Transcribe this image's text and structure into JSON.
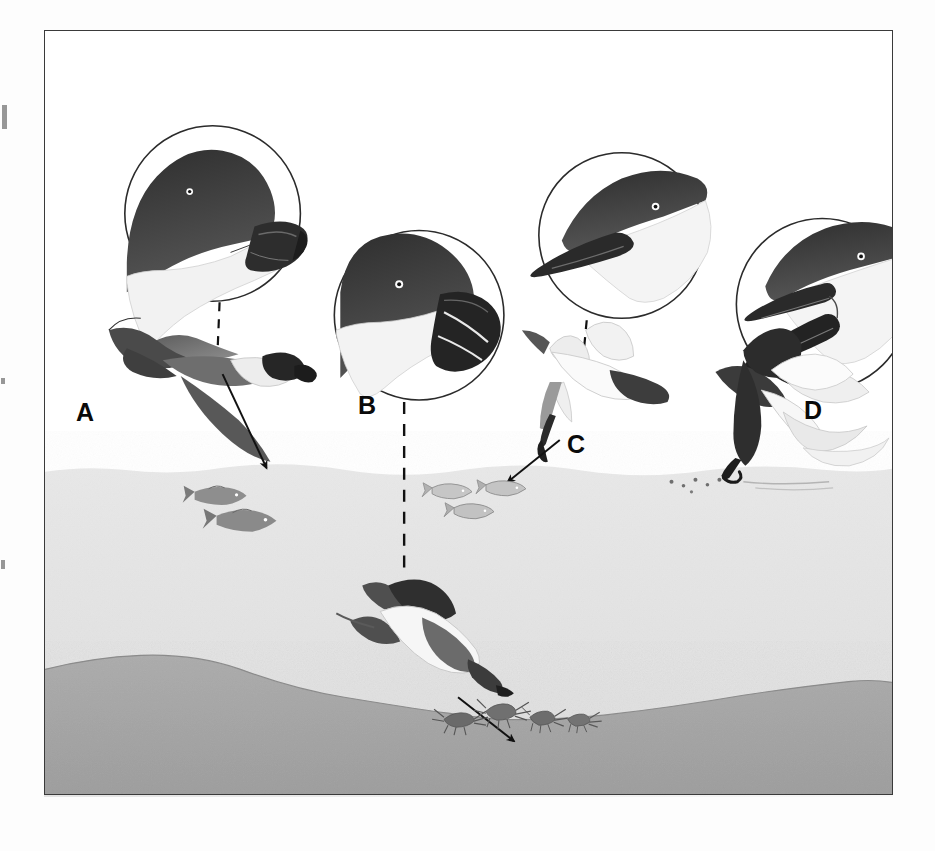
{
  "figure": {
    "caption_absent": true,
    "frame": {
      "border_color": "#3a3a3a"
    },
    "environment": {
      "sky_label": "air",
      "water_label": "water column",
      "seabed_label": "seabed",
      "colors": {
        "sky": "#ffffff",
        "water": "#e3e3e3",
        "seabed": "#a9a9a9",
        "ink": "#1a1a1a",
        "mid_gray": "#7d7d7d",
        "light_gray": "#c8c8c8"
      },
      "water_surface_y_pct": 58,
      "seabed_top_y_pct": 88
    },
    "labels": [
      {
        "id": "A",
        "text": "A",
        "x": 75,
        "y": 399
      },
      {
        "id": "B",
        "text": "B",
        "x": 357,
        "y": 392
      },
      {
        "id": "C",
        "text": "C",
        "x": 566,
        "y": 431
      },
      {
        "id": "D",
        "text": "D",
        "x": 803,
        "y": 397
      }
    ],
    "birds": [
      {
        "id": "A",
        "common_role": "surface-seizing petrel",
        "label": "A",
        "bill_type": "short hooked tube-nosed bill",
        "head_inset": {
          "name": "head-circle-a",
          "cx": 168,
          "cy": 183,
          "r": 88
        },
        "body": {
          "name": "bird-body-a",
          "posture": "flying above surface"
        },
        "leader": {
          "type": "dashed",
          "from": [
            175,
            270
          ],
          "to": [
            172,
            318
          ]
        },
        "feeding_arrow": {
          "from": [
            176,
            340
          ],
          "to": [
            226,
            478
          ],
          "target": "surface fish"
        },
        "prey": "fish at water surface"
      },
      {
        "id": "B",
        "common_role": "pursuit-diving auk",
        "label": "B",
        "bill_type": "deep stout bill with white grooves",
        "head_inset": {
          "name": "head-circle-b",
          "cx": 375,
          "cy": 285,
          "r": 85
        },
        "body": {
          "name": "bird-body-b",
          "posture": "swimming deep underwater"
        },
        "leader": {
          "type": "dashed",
          "from": [
            360,
            372
          ],
          "to": [
            360,
            545
          ]
        },
        "feeding_arrow": {
          "from": [
            407,
            660
          ],
          "to": [
            480,
            720
          ],
          "target": "benthic crustaceans"
        },
        "prey": "bottom crustaceans on seabed"
      },
      {
        "id": "C",
        "common_role": "plunge-diving tern",
        "label": "C",
        "bill_type": "long slender pointed bill",
        "head_inset": {
          "name": "head-circle-c",
          "cx": 578,
          "cy": 205,
          "r": 83
        },
        "body": {
          "name": "bird-body-c",
          "posture": "plunging toward surface"
        },
        "leader": {
          "type": "dashed",
          "from": [
            543,
            288
          ],
          "to": [
            538,
            330
          ]
        },
        "feeding_arrow": {
          "from": [
            512,
            432
          ],
          "to": [
            466,
            476
          ],
          "target": "shallow fish"
        },
        "prey": "small fish just below surface"
      },
      {
        "id": "D",
        "common_role": "skimmer",
        "label": "D",
        "bill_type": "open bill with elongated lower mandible",
        "head_inset": {
          "name": "head-circle-d",
          "cx": 779,
          "cy": 274,
          "r": 86
        },
        "body": {
          "name": "bird-body-d",
          "posture": "skimming the water surface"
        },
        "leader": {
          "type": "none"
        },
        "feeding_arrow": {
          "from": null,
          "to": null,
          "target": "surface film"
        },
        "prey": "prey skimmed at surface, ripple trail"
      }
    ],
    "prey_groups": [
      {
        "name": "fish-school-left",
        "count": 2,
        "x": 200,
        "y": 495,
        "size": "medium"
      },
      {
        "name": "fish-school-center",
        "count": 3,
        "x": 440,
        "y": 492,
        "size": "small"
      },
      {
        "name": "benthic-crustaceans",
        "count": 4,
        "x": 455,
        "y": 735,
        "size": "small"
      },
      {
        "name": "skimmer-ripple-specks",
        "count": 6,
        "x": 680,
        "y": 480,
        "size": "tiny"
      }
    ],
    "scan_artifacts": [
      {
        "name": "left-margin-mark-top",
        "x": 2,
        "y": 105,
        "w": 5,
        "h": 24
      },
      {
        "name": "left-margin-mark-mid",
        "x": 1,
        "y": 378,
        "w": 4,
        "h": 6
      },
      {
        "name": "left-margin-mark-low",
        "x": 1,
        "y": 560,
        "w": 4,
        "h": 9
      }
    ]
  }
}
